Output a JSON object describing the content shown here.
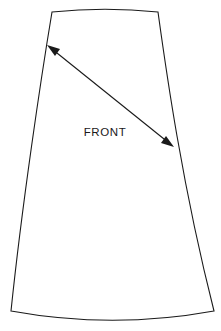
{
  "document": {
    "title": "Sewing pattern piece diagram",
    "background_color": "#ffffff",
    "line_color": "#1a1a1a",
    "fill_color": "#ffffff",
    "width": 221,
    "height": 331
  },
  "pattern_piece": {
    "name": "a-line-skirt-front-panel",
    "label": "FRONT",
    "label_position": {
      "x": 105,
      "y": 133
    },
    "outline": {
      "shape": "a-line-trapezoid",
      "top_left": {
        "x": 52,
        "y": 12
      },
      "top_right": {
        "x": 158,
        "y": 12
      },
      "bottom_left": {
        "x": 11,
        "y": 311
      },
      "bottom_right": {
        "x": 214,
        "y": 311
      },
      "top_edge": "concave-up-curve",
      "top_edge_mid_y": 9,
      "bottom_edge": "convex-down-curve",
      "bottom_edge_mid_y": 324,
      "left_edge": "slightly-concave-flare",
      "right_edge": "slightly-concave-flare",
      "path": "M 52 12 Q 105 6.5 158 12 C 166 70 182 185 214 311 Q 112.5 329.5 11 311 C 22 205 41 78 52 12 Z"
    }
  },
  "dimension_arrow": {
    "name": "bias-grainline-double-arrow",
    "style": "double-headed",
    "start": {
      "x": 47,
      "y": 45
    },
    "end": {
      "x": 174,
      "y": 147
    },
    "color": "#1a1a1a"
  }
}
